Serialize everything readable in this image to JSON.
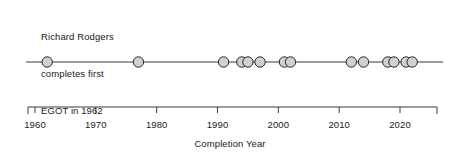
{
  "annotation": {
    "lines": [
      "Richard Rodgers",
      "completes first",
      "EGOT in 1962"
    ]
  },
  "axis": {
    "title": "Completion Year",
    "ticks": [
      1960,
      1970,
      1980,
      1990,
      2000,
      2010,
      2020
    ],
    "tick_labels": [
      "1960",
      "1970",
      "1980",
      "1990",
      "2000",
      "2010",
      "2020"
    ]
  },
  "style": {
    "marker_fill": "#d0d0d0",
    "marker_stroke": "#2b2b2b",
    "line_color": "#3a3a3a",
    "axis_color": "#3a3a3a",
    "text_color": "#1a1a1a"
  },
  "chart_data": {
    "type": "scatter",
    "title": "",
    "subtitle": "",
    "xlabel": "Completion Year",
    "ylabel": "",
    "xlim": [
      1959,
      2024
    ],
    "ylim": [
      0,
      1
    ],
    "grid": false,
    "legend": null,
    "orientation": "timeline",
    "series": [
      {
        "name": "EGOT completions",
        "values": [
          1962,
          1977,
          1991,
          1994,
          1995,
          1997,
          2001,
          2002,
          2012,
          2014,
          2018,
          2019,
          2021,
          2022
        ],
        "y_constant": 1
      }
    ],
    "annotations": [
      {
        "text": "Richard Rodgers completes first EGOT in 1962",
        "target_x": 1962,
        "position": "above-left"
      }
    ]
  }
}
